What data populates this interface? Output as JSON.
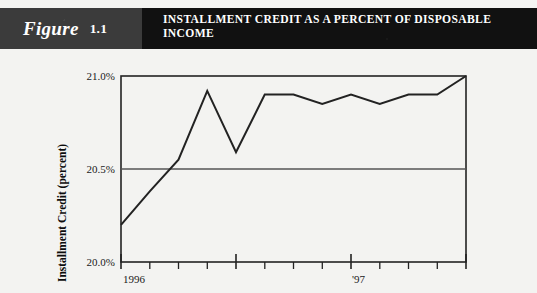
{
  "figure": {
    "label_word": "Figure",
    "number": "1.1",
    "title": "INSTALLMENT CREDIT AS A PERCENT OF DISPOSABLE\nINCOME"
  },
  "colors": {
    "band_left": "#3b3b3b",
    "band_right": "#111111",
    "band_text": "#ffffff",
    "page_background": "#f3f3f1",
    "plot_line": "#222222",
    "axis": "#222222",
    "gridline": "#555555"
  },
  "chart_data": {
    "type": "line",
    "title": "INSTALLMENT CREDIT AS A PERCENT OF DISPOSABLE INCOME",
    "xlabel": "",
    "ylabel": "Installment Credit (percent)",
    "ylim": [
      20.0,
      21.0
    ],
    "ytick_labels": [
      "21.0%",
      "20.5%",
      "20.0%"
    ],
    "ytick_values": [
      21.0,
      20.5,
      20.0
    ],
    "gridlines": [
      "20.5%"
    ],
    "grid": true,
    "legend": null,
    "xtick_labels": [
      "1996",
      "'97"
    ],
    "x_major_tick_indices": [
      0,
      4,
      8,
      12
    ],
    "x_labeled_tick_indices": [
      0,
      8
    ],
    "x_tick_count": 13,
    "x": [
      0,
      1,
      2,
      3,
      4,
      5,
      6,
      7,
      8,
      9,
      10,
      11,
      12
    ],
    "values": [
      20.2,
      20.38,
      20.55,
      20.92,
      20.59,
      20.9,
      20.9,
      20.85,
      20.9,
      20.85,
      20.9,
      20.9,
      21.0
    ],
    "series": [
      {
        "name": "Installment credit as a percent of disposable income",
        "values": [
          20.2,
          20.38,
          20.55,
          20.92,
          20.59,
          20.9,
          20.9,
          20.85,
          20.9,
          20.85,
          20.9,
          20.9,
          21.0
        ]
      }
    ]
  }
}
